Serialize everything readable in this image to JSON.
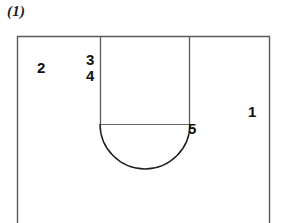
{
  "figure": {
    "caption": "(1)",
    "background_color": "#ffffff",
    "line_color": "#555555",
    "curve_color": "#1a1a1a",
    "label_color": "#111111"
  },
  "labels": {
    "region_1": "1",
    "region_2": "2",
    "region_3": "3",
    "region_4": "4",
    "region_5": "5"
  },
  "geometry": {
    "outer_rect": {
      "name": "outer-boundary-rectangle",
      "left": 17,
      "top": 36,
      "right": 270,
      "bottom_clipped_at": 223
    },
    "inner_channel": {
      "name": "u-shaped-channel",
      "left_vertical_x": 100,
      "right_vertical_x": 190,
      "top_y": 36,
      "base_y": 124
    },
    "semicircle": {
      "name": "semicircular-arc",
      "center_x": 145,
      "center_y": 124,
      "radius": 45,
      "bottom_y": 169,
      "orientation": "downward"
    }
  }
}
